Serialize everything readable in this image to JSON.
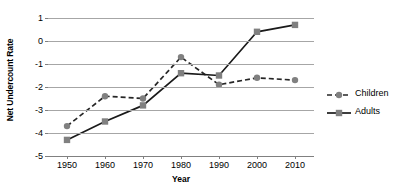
{
  "chart_data": {
    "type": "line",
    "title": "",
    "xlabel": "Year",
    "ylabel": "Net Undercount Rate",
    "x": [
      1950,
      1960,
      1970,
      1980,
      1990,
      2000,
      2010
    ],
    "xticklabels": [
      "1950",
      "1960",
      "1970",
      "1980",
      "1990",
      "2000",
      "2010"
    ],
    "yticks": [
      1,
      0,
      -1,
      -2,
      -3,
      -4,
      -5
    ],
    "yticklabels": [
      "1",
      "0",
      "-1",
      "-2",
      "-3",
      "-4",
      "-5"
    ],
    "ylim": [
      -5,
      1
    ],
    "xlim": [
      1945,
      2015
    ],
    "grid": "horizontal",
    "legend_position": "right",
    "series": [
      {
        "name": "Children",
        "values": [
          -3.7,
          -2.4,
          -2.5,
          -0.7,
          -1.9,
          -1.6,
          -1.7
        ],
        "linestyle": "dashed",
        "marker": "circle",
        "line_color": "#262626",
        "marker_color": "#808080"
      },
      {
        "name": "Adults",
        "values": [
          -4.3,
          -3.5,
          -2.8,
          -1.4,
          -1.5,
          0.4,
          0.7
        ],
        "linestyle": "solid",
        "marker": "square",
        "line_color": "#1a1a1a",
        "marker_color": "#808080"
      }
    ]
  },
  "legend": {
    "items": [
      {
        "label": "Children"
      },
      {
        "label": "Adults"
      }
    ]
  },
  "colors": {
    "gridline": "#a6a6a6",
    "axis": "#808080",
    "marker": "#808080",
    "line": "#1a1a1a",
    "text": "#000000",
    "background": "#ffffff"
  }
}
